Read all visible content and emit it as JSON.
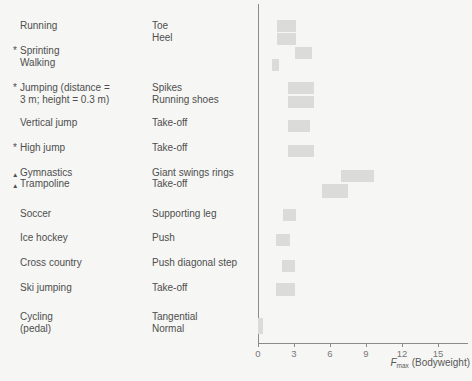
{
  "figure": {
    "background": "#f6f6f4",
    "bar_color": "#dbdbd9",
    "text_color": "#4e4e4e",
    "axis_color": "#8b8b8b",
    "tick_label_color": "#767676"
  },
  "left_column": {
    "lines": [
      {
        "marker": "",
        "text": "Running"
      },
      {
        "marker": "*",
        "text": "Sprinting"
      },
      {
        "marker": "",
        "text": "Walking"
      },
      {
        "marker": "*",
        "text": "Jumping (distance ="
      },
      {
        "marker": "",
        "text": "3 m; height = 0.3 m)"
      },
      {
        "marker": "",
        "text": "Vertical jump"
      },
      {
        "marker": "*",
        "text": "High jump"
      },
      {
        "marker": "▲",
        "text": "Gymnastics"
      },
      {
        "marker": "▲",
        "text": "Trampoline"
      },
      {
        "marker": "",
        "text": "Soccer"
      },
      {
        "marker": "",
        "text": "Ice hockey"
      },
      {
        "marker": "",
        "text": "Cross country"
      },
      {
        "marker": "",
        "text": "Ski jumping"
      },
      {
        "marker": "",
        "text": "Cycling"
      },
      {
        "marker": "",
        "text": "(pedal)"
      }
    ]
  },
  "middle_column": {
    "lines": [
      "Toe",
      "Heel",
      "Spikes",
      "Running shoes",
      "Take-off",
      "Take-off",
      "Giant swings rings",
      "Take-off",
      "Supporting leg",
      "Push",
      "Push diagonal step",
      "Take-off",
      "Tangential",
      "Normal"
    ]
  },
  "chart_data": {
    "type": "bar",
    "subtype": "horizontal-range-bars",
    "title": "",
    "xlabel_symbol": "F",
    "xlabel_subscript": "max",
    "xlabel_unit": "(Bodyweight)",
    "xlim": [
      0,
      16
    ],
    "x_ticks": [
      0,
      3,
      6,
      9,
      12,
      15
    ],
    "grid": false,
    "bars": [
      {
        "label": "Running — Toe",
        "bw_min": 1.6,
        "bw_max": 3.2
      },
      {
        "label": "Running — Heel",
        "bw_min": 1.6,
        "bw_max": 3.2
      },
      {
        "label": "Sprinting",
        "bw_min": 3.1,
        "bw_max": 4.5
      },
      {
        "label": "Walking",
        "bw_min": 1.2,
        "bw_max": 1.75
      },
      {
        "label": "Jumping — Spikes",
        "bw_min": 2.5,
        "bw_max": 4.7
      },
      {
        "label": "Jumping — Running shoes",
        "bw_min": 2.5,
        "bw_max": 4.7
      },
      {
        "label": "Vertical jump — Take-off",
        "bw_min": 2.5,
        "bw_max": 4.3
      },
      {
        "label": "High jump — Take-off",
        "bw_min": 2.5,
        "bw_max": 4.7
      },
      {
        "label": "Gymnastics — Giant swings rings",
        "bw_min": 6.9,
        "bw_max": 9.7
      },
      {
        "label": "Trampoline — Take-off",
        "bw_min": 5.3,
        "bw_max": 7.5
      },
      {
        "label": "Soccer — Supporting leg",
        "bw_min": 2.1,
        "bw_max": 3.2
      },
      {
        "label": "Ice hockey — Push",
        "bw_min": 1.5,
        "bw_max": 2.7
      },
      {
        "label": "Cross country — Push diagonal step",
        "bw_min": 2.0,
        "bw_max": 3.1
      },
      {
        "label": "Ski jumping — Take-off",
        "bw_min": 1.5,
        "bw_max": 3.1
      },
      {
        "label": "Cycling (pedal) — Tangential/Normal",
        "bw_min": 0.0,
        "bw_max": 0.45
      }
    ]
  }
}
